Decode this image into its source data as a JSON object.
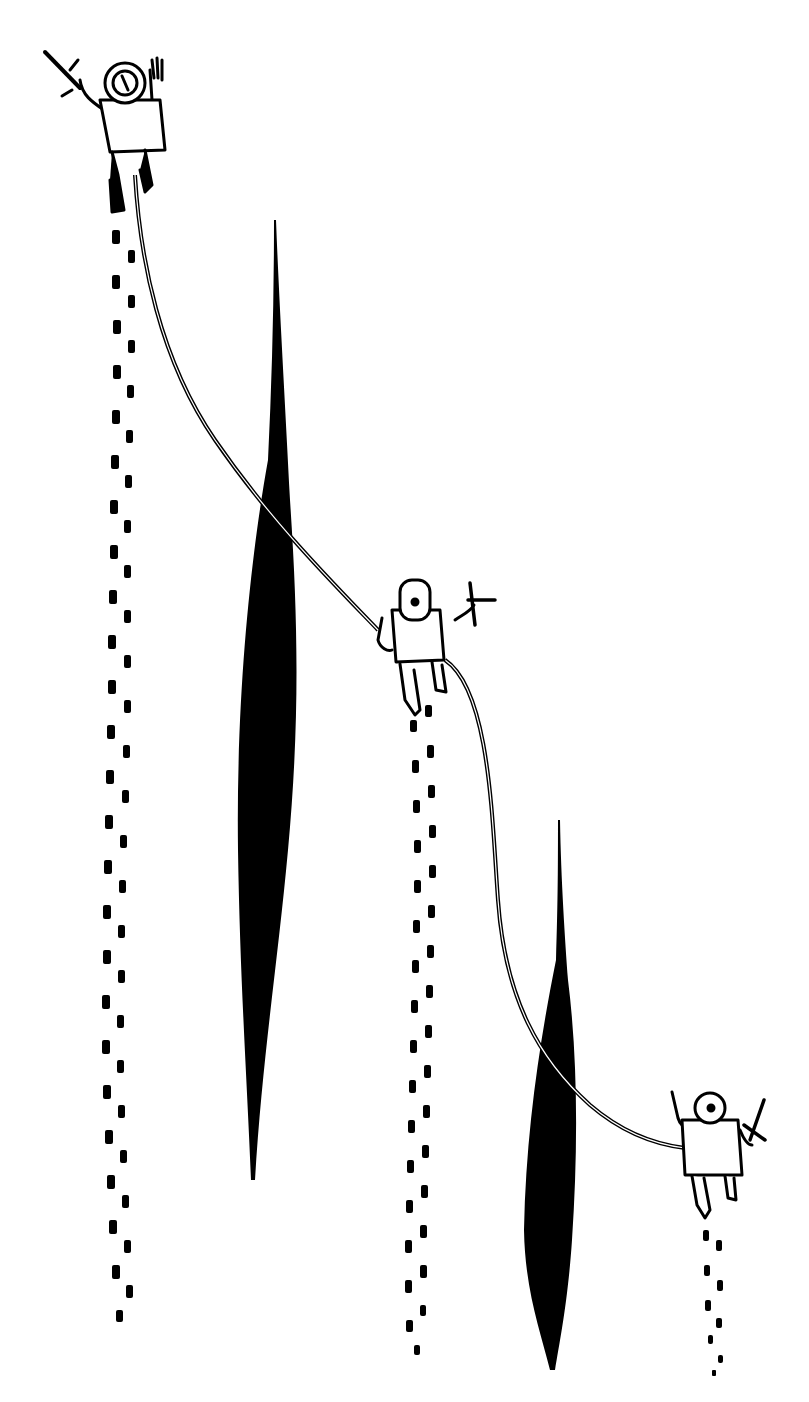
{
  "illustration": {
    "subject": "Three roped climbers seen from above crossing a glacier with crevasses",
    "background_color": "#ffffff",
    "ink_color": "#000000",
    "climbers": [
      {
        "position": "top-left",
        "x": 120,
        "y": 120,
        "holds": "ice-axe"
      },
      {
        "position": "middle",
        "x": 420,
        "y": 640,
        "holds": "ice-axe"
      },
      {
        "position": "bottom-right",
        "x": 710,
        "y": 1150,
        "holds": "ice-axe"
      }
    ],
    "crevasses": [
      {
        "x": 267,
        "top": 220,
        "bottom": 1180
      },
      {
        "x": 553,
        "top": 820,
        "bottom": 1370
      }
    ],
    "footprint_trails": 3,
    "rope_segments": 2
  }
}
